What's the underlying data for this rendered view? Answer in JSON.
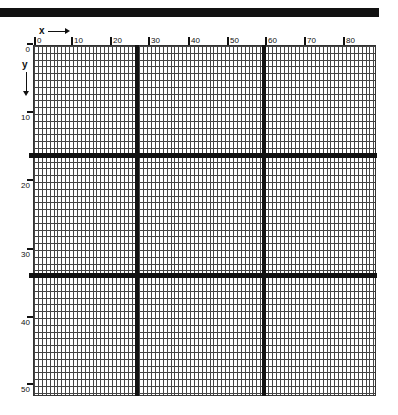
{
  "figure": {
    "axis_x": {
      "label": "x",
      "ticks": [
        "0",
        "10",
        "20",
        "30",
        "40",
        "50",
        "60",
        "70",
        "80"
      ]
    },
    "axis_y": {
      "label": "y",
      "ticks": [
        "0",
        "10",
        "20",
        "30",
        "40",
        "50"
      ]
    },
    "grid": {
      "columns": 88,
      "rows": 51,
      "line_color": "#444444"
    },
    "divider_color": "#111111",
    "vertical_dividers_at_x": [
      26,
      59
    ],
    "horizontal_dividers_at_y": [
      16,
      34
    ]
  }
}
